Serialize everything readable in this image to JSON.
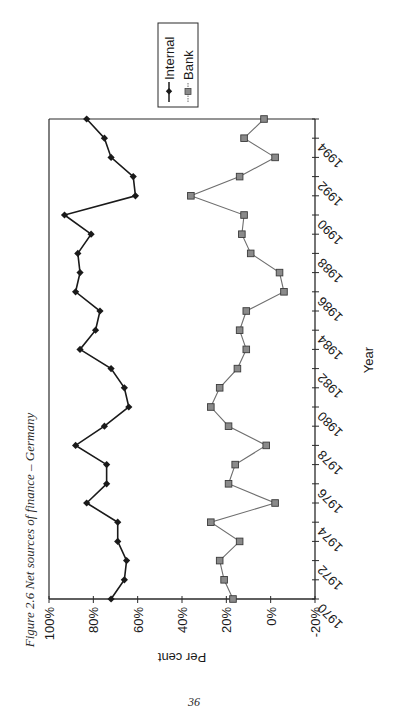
{
  "caption": "Figure 2.6 Net sources of finance – Germany",
  "page_number": "36",
  "chart_data": {
    "type": "line",
    "title": "Net sources of finance – Germany",
    "orientation": "rotated 90° counter-clockwise on page",
    "xlabel": "Year",
    "ylabel": "Per cent",
    "x": [
      1970,
      1971,
      1972,
      1973,
      1974,
      1975,
      1976,
      1977,
      1978,
      1979,
      1980,
      1981,
      1982,
      1983,
      1984,
      1985,
      1986,
      1987,
      1988,
      1989,
      1990,
      1991,
      1992,
      1993,
      1994,
      1995
    ],
    "x_tick_labels": [
      "1970",
      "1972",
      "1974",
      "1976",
      "1978",
      "1980",
      "1982",
      "1984",
      "1986",
      "1988",
      "1990",
      "1992",
      "1994"
    ],
    "y_tick_labels": [
      "100%",
      "80%",
      "60%",
      "40%",
      "20%",
      "0%",
      "-20%"
    ],
    "y_ticks": [
      100,
      80,
      60,
      40,
      20,
      0,
      -20
    ],
    "ylim": [
      -20,
      100
    ],
    "xlim": [
      1970,
      1995
    ],
    "grid": false,
    "legend_position": "top-right",
    "series": [
      {
        "name": "Internal",
        "marker": "diamond",
        "color": "#1a1a1a",
        "values": [
          72,
          66,
          65,
          69,
          69,
          83,
          74,
          74,
          88,
          75,
          64,
          66,
          72,
          86,
          79,
          77,
          88,
          86,
          87,
          81,
          93,
          61,
          62,
          72,
          75,
          83
        ]
      },
      {
        "name": "Bank",
        "marker": "square",
        "color": "#6e6e6e",
        "values": [
          17,
          21,
          23,
          14,
          27,
          -2,
          19,
          16,
          2,
          19,
          27,
          23,
          15,
          11,
          14,
          11,
          -6,
          -4,
          9,
          13,
          12,
          36,
          14,
          -2,
          12,
          3
        ]
      }
    ]
  }
}
